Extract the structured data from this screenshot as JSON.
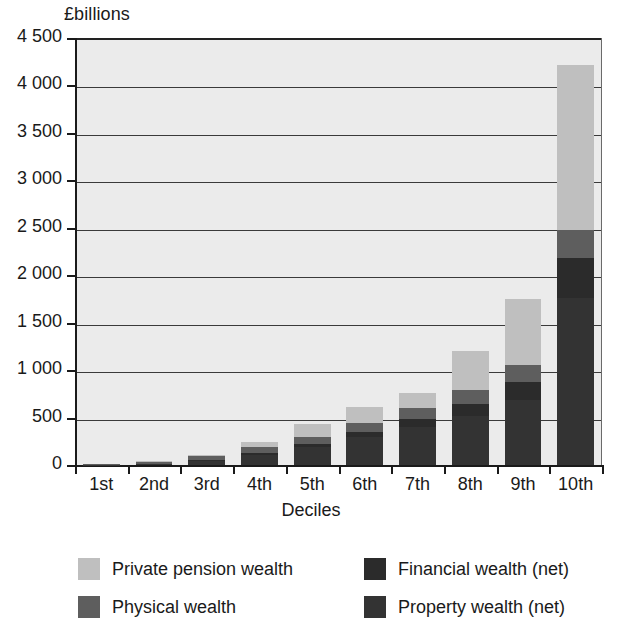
{
  "chart_data": {
    "type": "bar",
    "subtype": "stacked-vertical",
    "title": "",
    "xlabel": "Deciles",
    "ylabel": "£billions",
    "ylim": [
      0,
      4500
    ],
    "ytick_step": 500,
    "grid": true,
    "legend_position": "bottom",
    "categories": [
      "1st",
      "2nd",
      "3rd",
      "4th",
      "5th",
      "6th",
      "7th",
      "8th",
      "9th",
      "10th"
    ],
    "ytick_labels": [
      "0",
      "500",
      "1 000",
      "1 500",
      "2 000",
      "2 500",
      "3 000",
      "3 500",
      "4 000",
      "4 500"
    ],
    "ytick_values": [
      0,
      500,
      1000,
      1500,
      2000,
      2500,
      3000,
      3500,
      4000,
      4500
    ],
    "stack_order_bottom_to_top": [
      "Property wealth (net)",
      "Financial wealth (net)",
      "Physical wealth",
      "Private pension wealth"
    ],
    "series": [
      {
        "name": "Property wealth (net)",
        "color": "#333333",
        "values": [
          5,
          10,
          45,
          105,
          185,
          290,
          400,
          520,
          690,
          1760
        ]
      },
      {
        "name": "Financial wealth (net)",
        "color": "#2b2b2b",
        "values": [
          0,
          5,
          10,
          20,
          35,
          55,
          80,
          120,
          190,
          420
        ]
      },
      {
        "name": "Physical wealth",
        "color": "#5e5e5e",
        "values": [
          5,
          20,
          40,
          60,
          80,
          100,
          120,
          150,
          175,
          300
        ]
      },
      {
        "name": "Private pension wealth",
        "color": "#bfbfbf",
        "values": [
          0,
          5,
          15,
          60,
          135,
          170,
          160,
          410,
          700,
          1740
        ]
      }
    ],
    "totals": [
      10,
      40,
      110,
      245,
      435,
      615,
      760,
      1200,
      1755,
      4220
    ]
  },
  "axes": {
    "y_unit_label": "£billions",
    "x_axis_title": "Deciles"
  },
  "legend": {
    "entries": [
      {
        "label": "Private pension wealth",
        "color": "#bfbfbf"
      },
      {
        "label": "Financial wealth (net)",
        "color": "#2b2b2b"
      },
      {
        "label": "Physical wealth",
        "color": "#5e5e5e"
      },
      {
        "label": "Property wealth (net)",
        "color": "#333333"
      }
    ]
  },
  "style": {
    "plot_background": "#ebebeb",
    "axis_color": "#1a1a1a",
    "gridline_color": "#3a3a3a",
    "page_background": "#ffffff"
  }
}
